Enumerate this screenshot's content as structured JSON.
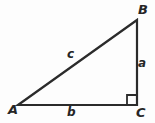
{
  "figure": {
    "name": "right-triangle-abc",
    "background_color": "#fdfdfd",
    "stroke_color": "#2b2b2b",
    "stroke_width": 2.2,
    "width": 155,
    "height": 123
  },
  "vertices": {
    "A": {
      "label": "A",
      "x": 18,
      "y": 105
    },
    "B": {
      "label": "B",
      "x": 137,
      "y": 20
    },
    "C": {
      "label": "C",
      "x": 137,
      "y": 105
    }
  },
  "sides": {
    "a": {
      "label": "a",
      "from": "B",
      "to": "C",
      "role": "opposite-A-vertical-leg"
    },
    "b": {
      "label": "b",
      "from": "A",
      "to": "C",
      "role": "opposite-B-horizontal-leg"
    },
    "c": {
      "label": "c",
      "from": "A",
      "to": "B",
      "role": "hypotenuse"
    }
  },
  "right_angle": {
    "at_vertex": "C",
    "marker": "square",
    "size": 10
  }
}
